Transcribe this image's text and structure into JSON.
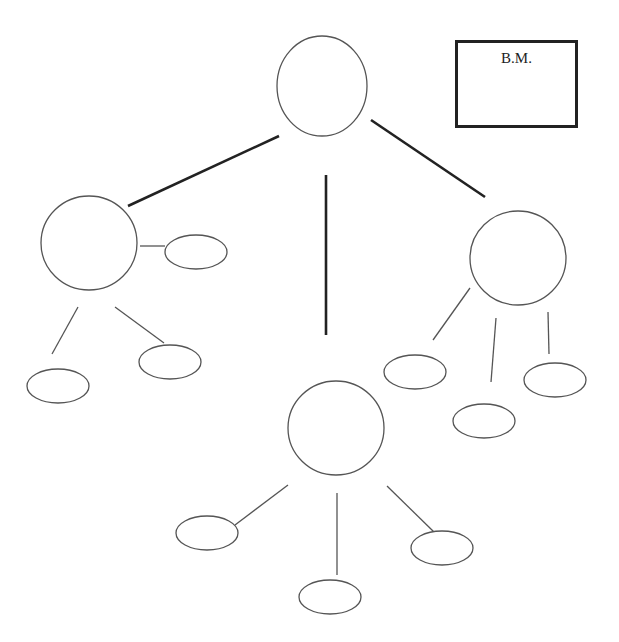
{
  "diagram": {
    "type": "concept-map",
    "label_box": {
      "text": "B.M.",
      "x": 455,
      "y": 40,
      "w": 123,
      "h": 88
    },
    "colors": {
      "main_line": "#222222",
      "branch_line": "#555555",
      "shape_stroke": "#555555",
      "background": "#ffffff"
    },
    "nodes": [
      {
        "id": "root",
        "kind": "circle",
        "cx": 322,
        "cy": 86,
        "rx": 45,
        "ry": 50
      },
      {
        "id": "left",
        "kind": "circle",
        "cx": 89,
        "cy": 243,
        "rx": 48,
        "ry": 47
      },
      {
        "id": "right",
        "kind": "circle",
        "cx": 518,
        "cy": 258,
        "rx": 48,
        "ry": 47
      },
      {
        "id": "bottom",
        "kind": "circle",
        "cx": 336,
        "cy": 428,
        "rx": 48,
        "ry": 47
      },
      {
        "id": "left-a",
        "kind": "ellipse",
        "cx": 196,
        "cy": 252,
        "rx": 31,
        "ry": 17
      },
      {
        "id": "left-b",
        "kind": "ellipse",
        "cx": 58,
        "cy": 386,
        "rx": 31,
        "ry": 17
      },
      {
        "id": "left-c",
        "kind": "ellipse",
        "cx": 170,
        "cy": 362,
        "rx": 31,
        "ry": 17
      },
      {
        "id": "right-a",
        "kind": "ellipse",
        "cx": 415,
        "cy": 372,
        "rx": 31,
        "ry": 17
      },
      {
        "id": "right-b",
        "kind": "ellipse",
        "cx": 484,
        "cy": 421,
        "rx": 31,
        "ry": 17
      },
      {
        "id": "right-c",
        "kind": "ellipse",
        "cx": 555,
        "cy": 380,
        "rx": 31,
        "ry": 17
      },
      {
        "id": "bottom-a",
        "kind": "ellipse",
        "cx": 207,
        "cy": 533,
        "rx": 31,
        "ry": 17
      },
      {
        "id": "bottom-b",
        "kind": "ellipse",
        "cx": 330,
        "cy": 597,
        "rx": 31,
        "ry": 17
      },
      {
        "id": "bottom-c",
        "kind": "ellipse",
        "cx": 442,
        "cy": 548,
        "rx": 31,
        "ry": 17
      }
    ],
    "edges": [
      {
        "from": "root",
        "to": "left",
        "x1": 279,
        "y1": 136,
        "x2": 128,
        "y2": 206,
        "weight": "main"
      },
      {
        "from": "root",
        "to": "bottom",
        "x1": 326,
        "y1": 175,
        "x2": 326,
        "y2": 335,
        "weight": "main"
      },
      {
        "from": "root",
        "to": "right",
        "x1": 371,
        "y1": 120,
        "x2": 485,
        "y2": 197,
        "weight": "main"
      },
      {
        "from": "left",
        "to": "left-a",
        "x1": 140,
        "y1": 246,
        "x2": 165,
        "y2": 246,
        "weight": "branch"
      },
      {
        "from": "left",
        "to": "left-b",
        "x1": 78,
        "y1": 307,
        "x2": 52,
        "y2": 354,
        "weight": "branch"
      },
      {
        "from": "left",
        "to": "left-c",
        "x1": 115,
        "y1": 307,
        "x2": 164,
        "y2": 343,
        "weight": "branch"
      },
      {
        "from": "right",
        "to": "right-a",
        "x1": 470,
        "y1": 288,
        "x2": 433,
        "y2": 340,
        "weight": "branch"
      },
      {
        "from": "right",
        "to": "right-b",
        "x1": 496,
        "y1": 318,
        "x2": 491,
        "y2": 382,
        "weight": "branch"
      },
      {
        "from": "right",
        "to": "right-c",
        "x1": 548,
        "y1": 312,
        "x2": 549,
        "y2": 354,
        "weight": "branch"
      },
      {
        "from": "bottom",
        "to": "bottom-a",
        "x1": 288,
        "y1": 485,
        "x2": 235,
        "y2": 525,
        "weight": "branch"
      },
      {
        "from": "bottom",
        "to": "bottom-b",
        "x1": 337,
        "y1": 493,
        "x2": 337,
        "y2": 575,
        "weight": "branch"
      },
      {
        "from": "bottom",
        "to": "bottom-c",
        "x1": 387,
        "y1": 486,
        "x2": 434,
        "y2": 532,
        "weight": "branch"
      }
    ]
  }
}
